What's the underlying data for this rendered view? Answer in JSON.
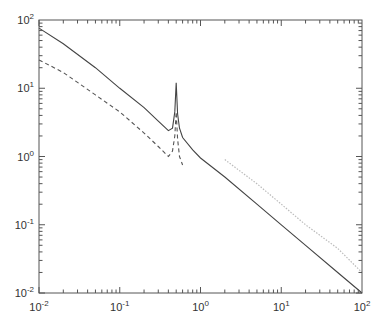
{
  "chart_data": {
    "type": "line",
    "title": "",
    "xlabel": "",
    "ylabel": "",
    "xscale": "log",
    "yscale": "log",
    "xlim": [
      0.01,
      100
    ],
    "ylim": [
      0.01,
      100
    ],
    "grid": false,
    "legend": null,
    "x_ticks": [
      {
        "value": 0.01,
        "base": "10",
        "exp": "-2"
      },
      {
        "value": 0.1,
        "base": "10",
        "exp": "-1"
      },
      {
        "value": 1,
        "base": "10",
        "exp": "0"
      },
      {
        "value": 10,
        "base": "10",
        "exp": "1"
      },
      {
        "value": 100,
        "base": "10",
        "exp": "2"
      }
    ],
    "y_ticks": [
      {
        "value": 0.01,
        "base": "10",
        "exp": "-2"
      },
      {
        "value": 0.1,
        "base": "10",
        "exp": "-1"
      },
      {
        "value": 1,
        "base": "10",
        "exp": "0"
      },
      {
        "value": 10,
        "base": "10",
        "exp": "1"
      },
      {
        "value": 100,
        "base": "10",
        "exp": "2"
      }
    ],
    "series": [
      {
        "name": "solid",
        "style": "solid",
        "color": "#444444",
        "x": [
          0.01,
          0.02,
          0.05,
          0.1,
          0.2,
          0.3,
          0.4,
          0.45,
          0.48,
          0.5,
          0.52,
          0.55,
          0.6,
          0.8,
          1,
          2,
          5,
          10,
          20,
          50,
          100
        ],
        "y": [
          76,
          45,
          20,
          10,
          5.2,
          3.3,
          2.4,
          2.6,
          4.5,
          12,
          4.2,
          2.6,
          1.9,
          1.25,
          0.95,
          0.5,
          0.2,
          0.1,
          0.05,
          0.02,
          0.01
        ]
      },
      {
        "name": "dashed",
        "style": "dashed",
        "color": "#555555",
        "x": [
          0.01,
          0.02,
          0.05,
          0.1,
          0.2,
          0.3,
          0.4,
          0.45,
          0.48,
          0.5,
          0.52,
          0.55,
          0.6
        ],
        "y": [
          26,
          17,
          8,
          4.5,
          2.2,
          1.4,
          1.0,
          1.2,
          2.0,
          4.5,
          1.8,
          1.0,
          0.75
        ]
      },
      {
        "name": "dotted",
        "style": "dotted",
        "color": "#bbbbbb",
        "x": [
          2,
          5,
          10,
          20,
          50,
          100
        ],
        "y": [
          0.9,
          0.4,
          0.2,
          0.1,
          0.045,
          0.02
        ]
      }
    ]
  }
}
